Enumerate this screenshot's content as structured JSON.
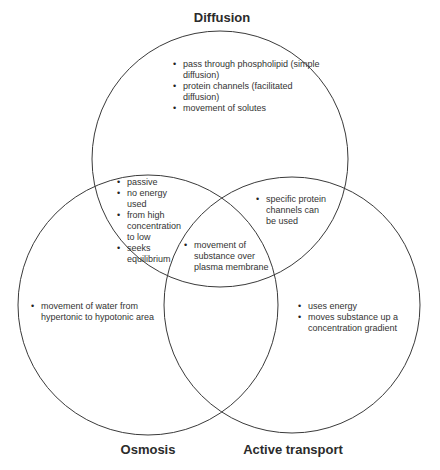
{
  "diagram": {
    "type": "venn-3",
    "stroke_color": "#3a3a3a",
    "sets": [
      {
        "id": "diffusion",
        "label": "Diffusion",
        "cx": 220,
        "cy": 159,
        "r": 128
      },
      {
        "id": "osmosis",
        "label": "Osmosis",
        "cx": 148,
        "cy": 305,
        "r": 130
      },
      {
        "id": "active",
        "label": "Active transport",
        "cx": 292,
        "cy": 305,
        "r": 128
      }
    ],
    "regions": {
      "diffusion_only": [
        "pass through phospholipid (simple diffusion)",
        "protein channels (facilitated diffusion)",
        "movement of solutes"
      ],
      "diffusion_osmosis": [
        "passive",
        "no energy used",
        "from high concentration to low",
        "seeks equilibrium"
      ],
      "diffusion_active": [
        "specific protein channels can be used"
      ],
      "all_three": [
        "movement of substance over plasma membrane"
      ],
      "osmosis_only": [
        "movement of water from hypertonic to hypotonic area"
      ],
      "active_only": [
        "uses energy",
        "moves substance up a concentration gradient"
      ]
    }
  }
}
